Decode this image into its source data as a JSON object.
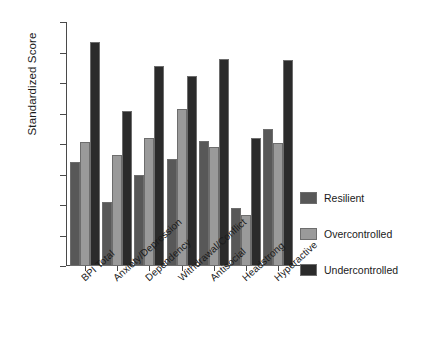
{
  "chart_data": {
    "type": "bar",
    "title": "",
    "xlabel": "",
    "ylabel": "Standardized Score",
    "ylim": [
      96,
      112
    ],
    "yticks": [
      96,
      98,
      100,
      102,
      104,
      106,
      108,
      110,
      112
    ],
    "grid": false,
    "legend_position": "right",
    "categories": [
      "BPI Total",
      "Anxiety/Depression",
      "Dependency",
      "Withdrawal/Conflict",
      "Antisocial",
      "Headstrong",
      "Hyperactive"
    ],
    "series": [
      {
        "name": "Resilient",
        "color": "#585858",
        "values": [
          102.85,
          100.2,
          102.0,
          103.05,
          104.2,
          99.8,
          105.0
        ]
      },
      {
        "name": "Overcontrolled",
        "color": "#9a9a9a",
        "values": [
          104.1,
          103.3,
          104.4,
          106.3,
          103.8,
          99.35,
          104.05
        ]
      },
      {
        "name": "Undercontrolled",
        "color": "#2b2b2b",
        "values": [
          110.7,
          106.15,
          109.1,
          108.45,
          109.6,
          104.4,
          109.5
        ]
      }
    ]
  },
  "legend": {
    "items": [
      {
        "label": "Resilient"
      },
      {
        "label": "Overcontrolled"
      },
      {
        "label": "Undercontrolled"
      }
    ]
  },
  "axes": {
    "y_title": "Standardized Score"
  }
}
